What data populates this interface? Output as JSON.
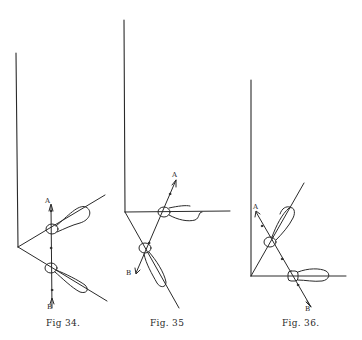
{
  "figures": [
    {
      "caption": "Fig 34.",
      "labels": {
        "a": "A",
        "b": "B"
      }
    },
    {
      "caption": "Fig. 35",
      "labels": {
        "a": "A",
        "b": "B"
      }
    },
    {
      "caption": "Fig. 36.",
      "labels": {
        "a": "A",
        "b": "B"
      }
    }
  ],
  "colors": {
    "ink": "#2a2a2a",
    "paper": "#ffffff"
  }
}
